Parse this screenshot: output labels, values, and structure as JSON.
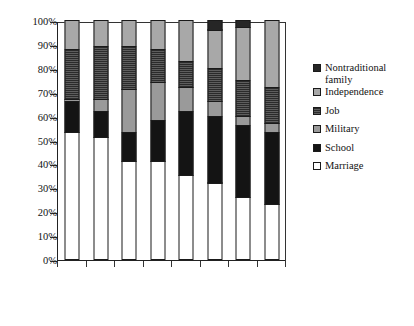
{
  "chart_data": {
    "type": "bar",
    "subtype": "stacked-percentage-column",
    "title": "",
    "subtitle": "",
    "xlabel": "",
    "ylabel": "",
    "ylim": [
      0,
      100
    ],
    "y_unit": "%",
    "grid": false,
    "legend_position": "right",
    "categories": [
      "1920-29",
      "1930-37",
      "1938-44",
      "1945-58",
      "1959-65",
      "1966-72",
      "1973-79",
      "1980-85"
    ],
    "ytick_labels": [
      "0%",
      "10%",
      "20%",
      "30%",
      "40%",
      "50%",
      "60%",
      "70%",
      "80%",
      "90%",
      "100%"
    ],
    "ytick_values": [
      0,
      10,
      20,
      30,
      40,
      50,
      60,
      70,
      80,
      90,
      100
    ],
    "series": [
      {
        "name": "Marriage",
        "swatch": "white-open",
        "color": "#ffffff",
        "values": [
          53,
          51,
          41,
          41,
          35,
          32,
          26,
          23
        ]
      },
      {
        "name": "School",
        "swatch": "solid-black",
        "color": "#141414",
        "values": [
          13,
          11,
          12,
          17,
          27,
          28,
          30,
          30
        ]
      },
      {
        "name": "Military",
        "swatch": "light-grey",
        "color": "#9a9a9a",
        "values": [
          1,
          5,
          18,
          16,
          10,
          6,
          4,
          4
        ]
      },
      {
        "name": "Job",
        "swatch": "dark-hatched",
        "color": "#3a3a3a",
        "values": [
          21,
          22,
          18,
          14,
          11,
          14,
          15,
          15
        ]
      },
      {
        "name": "Independence",
        "swatch": "mid-grey",
        "color": "#a8a8a8",
        "values": [
          12,
          11,
          11,
          12,
          17,
          16,
          22,
          28
        ]
      },
      {
        "name": "Nontraditional family",
        "swatch": "very-dark-grey",
        "color": "#262626",
        "values": [
          0,
          0,
          0,
          0,
          0,
          4,
          3,
          0
        ]
      }
    ]
  },
  "legend": {
    "entries": [
      {
        "label": "Nontraditional\nfamily",
        "series": "Nontraditional family"
      },
      {
        "label": "Independence",
        "series": "Independence"
      },
      {
        "label": "Job",
        "series": "Job"
      },
      {
        "label": "Military",
        "series": "Military"
      },
      {
        "label": "School",
        "series": "School"
      },
      {
        "label": "Marriage",
        "series": "Marriage"
      }
    ]
  }
}
